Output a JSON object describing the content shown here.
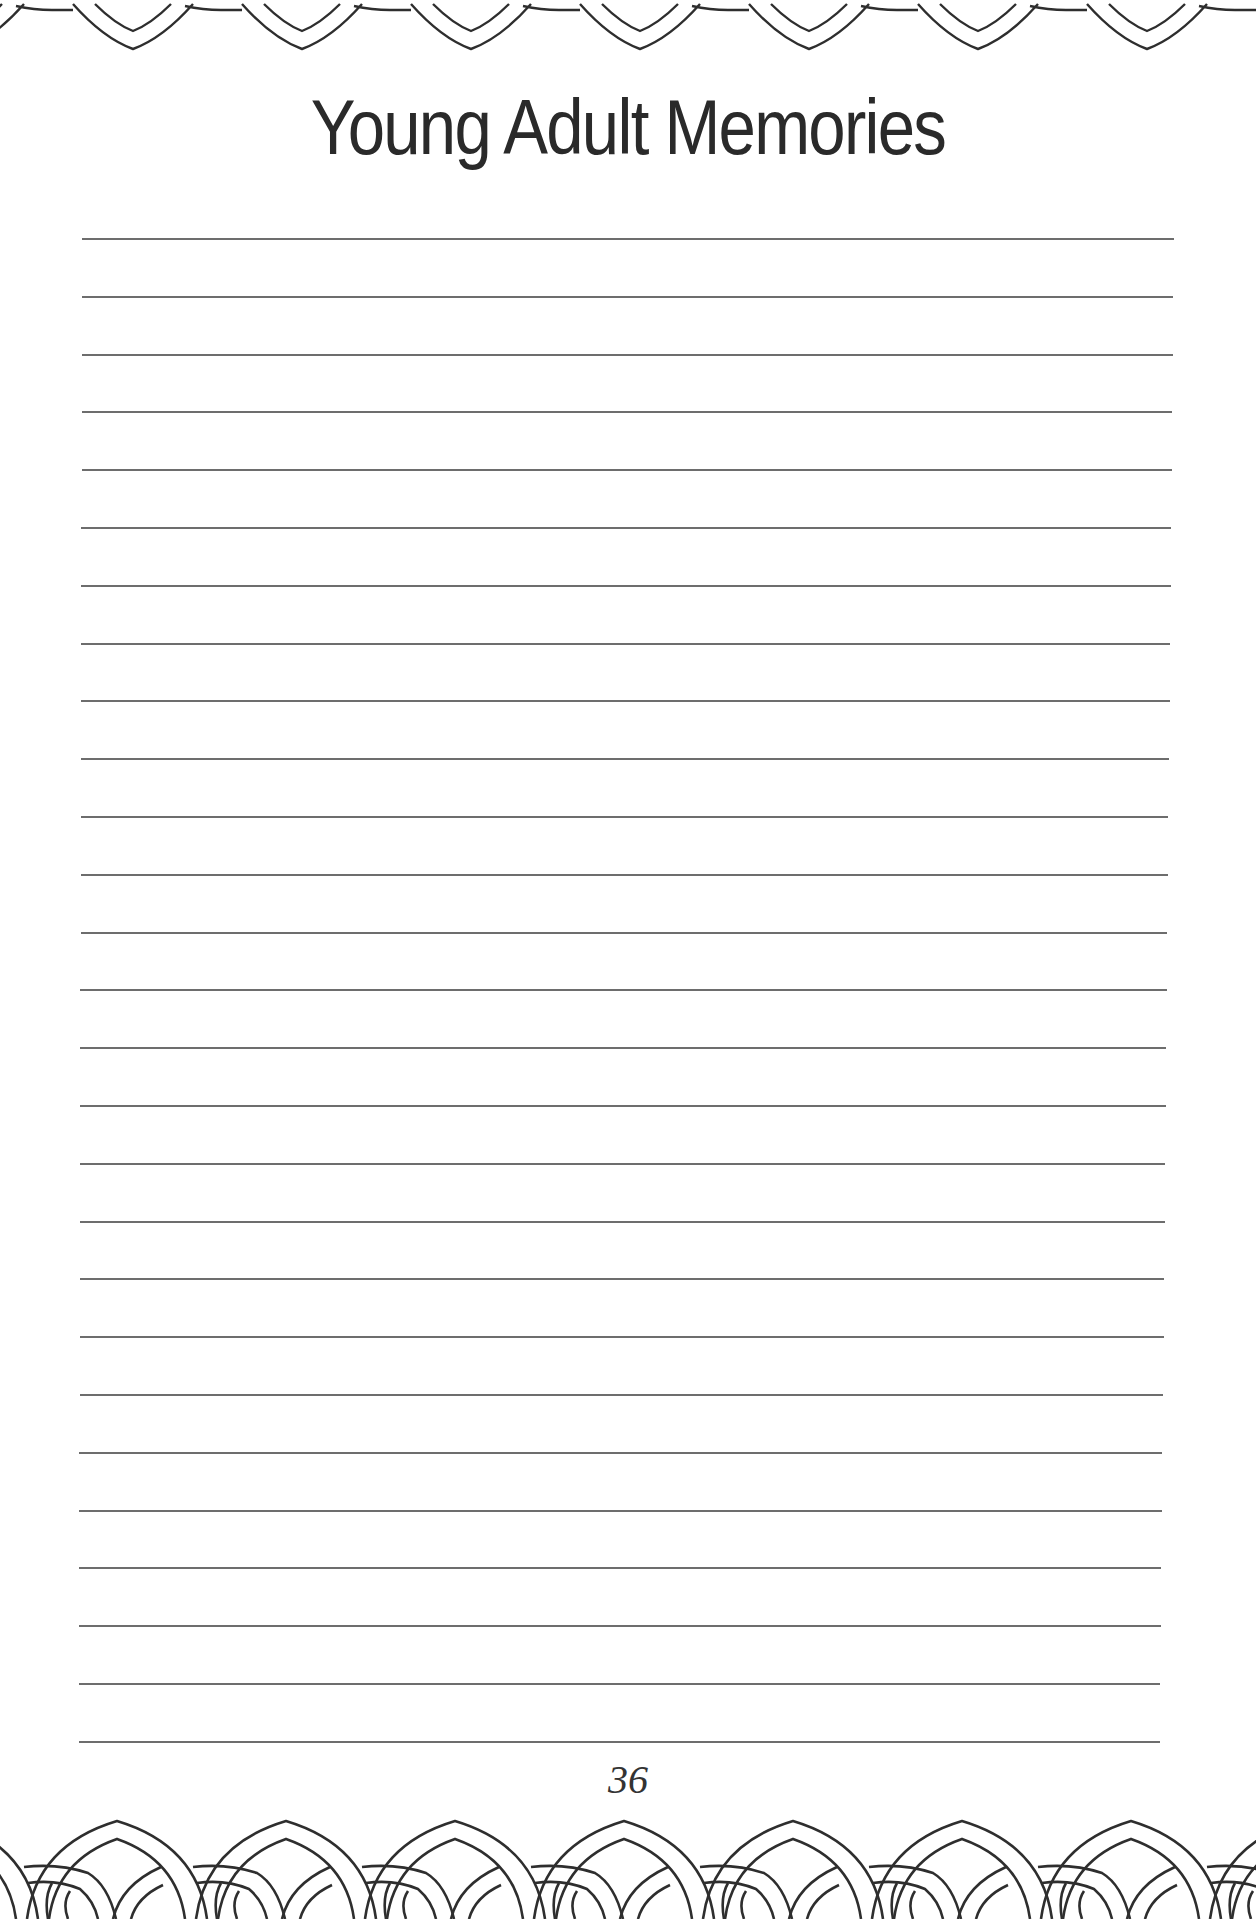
{
  "page": {
    "title": "Young Adult Memories",
    "page_number": "36",
    "line_count": 27,
    "line_color": "#6d6d6d",
    "ink_color": "#2a2a2a",
    "background": "#ffffff"
  },
  "decorations": {
    "top_border": "scalloped-chain-border-icon",
    "bottom_border": "interlocking-rings-border-icon"
  }
}
